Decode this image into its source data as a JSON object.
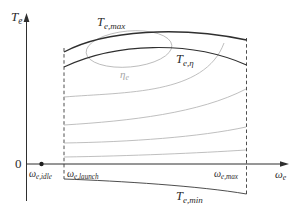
{
  "figure": {
    "y_axis_label": {
      "base": "T",
      "sub": "e"
    },
    "x_axis_label": {
      "base": "ω",
      "sub": "e"
    },
    "origin_label": "0",
    "x_ticks": {
      "idle": {
        "base": "ω",
        "sub": "e,idle"
      },
      "launch": {
        "base": "ω",
        "sub": "e,launch"
      },
      "max": {
        "base": "ω",
        "sub": "e,max"
      }
    },
    "curves": {
      "te_max": {
        "base": "T",
        "sub": "e,max"
      },
      "te_eta": {
        "base": "T",
        "sub": "e,η"
      },
      "te_min": {
        "base": "T",
        "sub": "e,min"
      },
      "eta_contour": {
        "base": "η",
        "sub": "e"
      }
    },
    "colors": {
      "line_dark": "#2f2f2f",
      "contour_gray": "#b3b3b3",
      "eta_label_gray": "#a6a6a6",
      "background": "#ffffff"
    }
  }
}
